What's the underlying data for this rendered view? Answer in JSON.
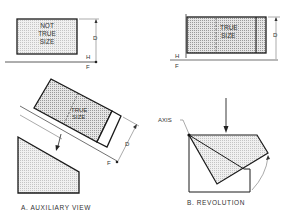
{
  "colors": {
    "line": "#1a1a1a",
    "shade": "#cfcfcf",
    "shade_light": "#e2e2e2",
    "text": "#333333"
  },
  "panel_a": {
    "caption": "A. AUXILIARY VIEW",
    "top_view_text": [
      "NOT",
      "TRUE",
      "SIZE"
    ],
    "aux_view_text": [
      "TRUE",
      "SIZE"
    ],
    "dim_label": "D",
    "fold_top": "H",
    "fold_bottom": "F",
    "aux_fold": "F"
  },
  "panel_b": {
    "caption": "B. REVOLUTION",
    "top_view_text": [
      "TRUE",
      "SIZE"
    ],
    "dim_label": "D",
    "fold_top": "H",
    "fold_bottom": "F",
    "axis_label": "AXIS"
  }
}
